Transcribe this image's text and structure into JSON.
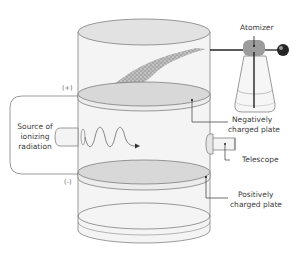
{
  "diagram": {
    "labels": {
      "atomizer": "Atomizer",
      "negative_plate_line1": "Negatively",
      "negative_plate_line2": "charged plate",
      "telescope": "Telescope",
      "positive_plate_line1": "Positively",
      "positive_plate_line2": "charged plate",
      "source_line1": "Source of",
      "source_line2": "ionizing",
      "source_line3": "radiation",
      "plus_sign": "(+)",
      "minus_sign": "(-)"
    },
    "colors": {
      "outline": "#6b6b6b",
      "cylinder_fill": "#f3f3f3",
      "plate_fill": "#d9d9d9",
      "spray_fill": "#a8a8a8",
      "atomizer_bulb": "#2b2b2b",
      "atomizer_head": "#9a9a9a",
      "leader_line": "#333333"
    }
  }
}
